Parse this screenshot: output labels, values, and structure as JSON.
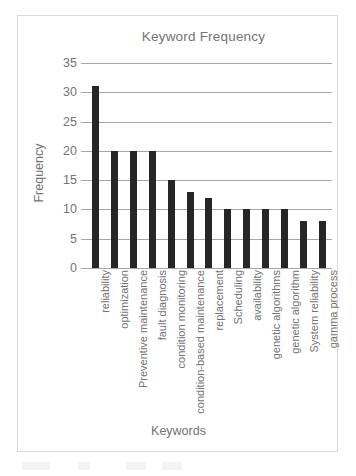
{
  "chart_data": {
    "type": "bar",
    "title": "Keyword Frequency",
    "xlabel": "Keywords",
    "ylabel": "Frequency",
    "categories": [
      "reliability",
      "optimization",
      "Preventive maintenance",
      "fault diagnosis",
      "condition monitoring",
      "condition-based maintenance",
      "replacement",
      "Scheduling",
      "availability",
      "genetic algorithms",
      "genetic algorithm",
      "System reliability",
      "gamma process"
    ],
    "values": [
      31,
      20,
      20,
      20,
      15,
      13,
      12,
      10,
      10,
      10,
      10,
      8,
      8
    ],
    "ylim": [
      0,
      35
    ],
    "yticks": [
      0,
      5,
      10,
      15,
      20,
      25,
      30,
      35
    ],
    "ytick_labels": [
      "0",
      "5",
      "10",
      "15",
      "20",
      "25",
      "30",
      "35"
    ],
    "grid": true,
    "legend": false,
    "bar_color": "#262626",
    "gridline_color": "#a6a6a6",
    "text_color": "#737373",
    "frame_color": "#dcdcdc",
    "background": "#ffffff"
  }
}
